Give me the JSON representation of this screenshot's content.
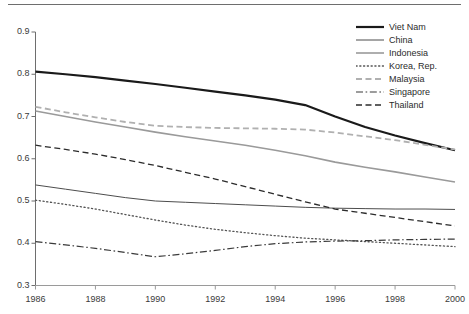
{
  "chart_data": {
    "type": "line",
    "title": "",
    "subtitle": "",
    "xlabel": "",
    "ylabel": "",
    "x": [
      1986,
      1987,
      1988,
      1989,
      1990,
      1991,
      1992,
      1993,
      1994,
      1995,
      1996,
      1997,
      1998,
      1999,
      2000
    ],
    "xlim": [
      1986,
      2000
    ],
    "ylim": [
      0.3,
      0.9
    ],
    "xticks": [
      1986,
      1988,
      1990,
      1992,
      1994,
      1996,
      1998,
      2000
    ],
    "xtick_labels": [
      "1986",
      "1988",
      "1990",
      "1992",
      "1994",
      "1996",
      "1998",
      "2000"
    ],
    "yticks": [
      0.3,
      0.4,
      0.5,
      0.6,
      0.7,
      0.8,
      0.9
    ],
    "ytick_labels": [
      "0.3",
      "0.4",
      "0.5",
      "0.6",
      "0.7",
      "0.8",
      "0.9"
    ],
    "grid": false,
    "legend_position": "top-right",
    "series": [
      {
        "name": "Viet Nam",
        "style": "solid",
        "color": "#1a1a1a",
        "width": 2.2,
        "values": [
          0.806,
          0.8,
          0.793,
          0.785,
          0.777,
          0.768,
          0.759,
          0.75,
          0.74,
          0.727,
          0.7,
          0.675,
          0.655,
          0.637,
          0.62
        ]
      },
      {
        "name": "China",
        "style": "solid",
        "color": "#4d4d4d",
        "width": 1.0,
        "values": [
          0.538,
          0.528,
          0.518,
          0.508,
          0.5,
          0.497,
          0.494,
          0.491,
          0.488,
          0.485,
          0.483,
          0.482,
          0.481,
          0.481,
          0.48
        ]
      },
      {
        "name": "Indonesia",
        "style": "solid",
        "color": "#9a9a9a",
        "width": 1.6,
        "values": [
          0.713,
          0.7,
          0.687,
          0.675,
          0.663,
          0.652,
          0.642,
          0.632,
          0.62,
          0.607,
          0.592,
          0.58,
          0.569,
          0.557,
          0.545
        ]
      },
      {
        "name": "Korea, Rep.",
        "style": "dotted",
        "color": "#555555",
        "width": 1.3,
        "values": [
          0.502,
          0.492,
          0.481,
          0.468,
          0.455,
          0.443,
          0.433,
          0.425,
          0.418,
          0.412,
          0.408,
          0.404,
          0.4,
          0.396,
          0.392
        ]
      },
      {
        "name": "Malaysia",
        "style": "dashed",
        "color": "#b0b0b0",
        "width": 1.8,
        "values": [
          0.723,
          0.71,
          0.698,
          0.687,
          0.678,
          0.675,
          0.673,
          0.672,
          0.671,
          0.669,
          0.662,
          0.653,
          0.644,
          0.633,
          0.622
        ]
      },
      {
        "name": "Singapore",
        "style": "dashdot",
        "color": "#3a3a3a",
        "width": 1.2,
        "values": [
          0.404,
          0.396,
          0.388,
          0.378,
          0.368,
          0.375,
          0.383,
          0.392,
          0.399,
          0.403,
          0.405,
          0.406,
          0.408,
          0.409,
          0.41
        ]
      },
      {
        "name": "Thailand",
        "style": "dashed",
        "color": "#2b2b2b",
        "width": 1.3,
        "values": [
          0.632,
          0.622,
          0.611,
          0.598,
          0.584,
          0.568,
          0.552,
          0.534,
          0.516,
          0.498,
          0.481,
          0.471,
          0.461,
          0.451,
          0.441
        ]
      }
    ]
  },
  "legend": {
    "entries": [
      {
        "label": "Viet Nam"
      },
      {
        "label": "China"
      },
      {
        "label": "Indonesia"
      },
      {
        "label": "Korea, Rep."
      },
      {
        "label": "Malaysia"
      },
      {
        "label": "Singapore"
      },
      {
        "label": "Thailand"
      }
    ]
  },
  "axes": {
    "y_labels": [
      "0.9",
      "0.8",
      "0.7",
      "0.6",
      "0.5",
      "0.4",
      "0.3"
    ],
    "x_labels": [
      "1986",
      "1988",
      "1990",
      "1992",
      "1994",
      "1996",
      "1998",
      "2000"
    ]
  }
}
